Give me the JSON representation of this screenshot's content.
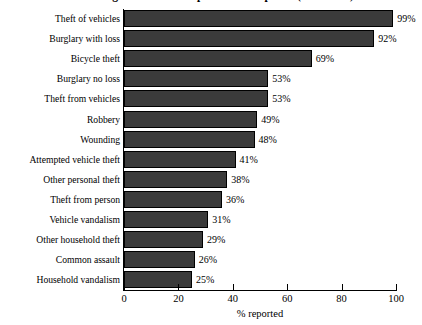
{
  "chart_data": {
    "type": "bar",
    "orientation": "horizontal",
    "title": "Percentage of incidents reported to the police (BCS 2000)",
    "xlabel": "% reported",
    "ylabel": "",
    "xlim": [
      0,
      100
    ],
    "xticks": [
      0,
      20,
      40,
      60,
      80,
      100
    ],
    "xtick_labels": [
      "0",
      "20",
      "40",
      "60",
      "80",
      "100"
    ],
    "grid": false,
    "legend": "none",
    "value_label_suffix": "%",
    "bar_color": "#3b3b3b",
    "bar_edge_color": "#000000",
    "categories": [
      "Theft of vehicles",
      "Burglary with loss",
      "Bicycle theft",
      "Burglary no loss",
      "Theft from vehicles",
      "Robbery",
      "Wounding",
      "Attempted vehicle theft",
      "Other personal theft",
      "Theft from person",
      "Vehicle vandalism",
      "Other household theft",
      "Common assault",
      "Household vandalism"
    ],
    "values": [
      99,
      92,
      69,
      53,
      53,
      49,
      48,
      41,
      38,
      36,
      31,
      29,
      26,
      25
    ],
    "value_labels": [
      "99%",
      "92%",
      "69%",
      "53%",
      "53%",
      "49%",
      "48%",
      "41%",
      "38%",
      "36%",
      "31%",
      "29%",
      "26%",
      "25%"
    ]
  }
}
